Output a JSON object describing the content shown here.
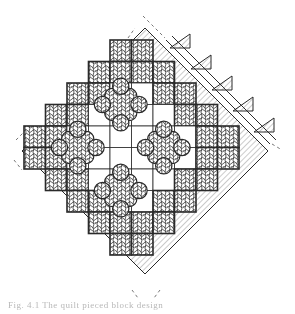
{
  "figure": {
    "type": "quilt-pattern-drawing",
    "grid": {
      "cell_size": 21.5,
      "origin_x": 24,
      "origin_y": 40,
      "rows": [
        {
          "start": 4,
          "cells": [
            "d",
            "d"
          ]
        },
        {
          "start": 3,
          "cells": [
            "d",
            "d",
            "d",
            "d"
          ]
        },
        {
          "start": 2,
          "cells": [
            "d",
            "d",
            "w",
            "w",
            "d",
            "d"
          ]
        },
        {
          "start": 1,
          "cells": [
            "d",
            "d",
            "w",
            "w",
            "w",
            "w",
            "d",
            "d"
          ]
        },
        {
          "start": 0,
          "cells": [
            "d",
            "d",
            "w",
            "w",
            "w",
            "w",
            "w",
            "w",
            "d",
            "d"
          ]
        },
        {
          "start": 0,
          "cells": [
            "d",
            "d",
            "w",
            "w",
            "w",
            "w",
            "w",
            "w",
            "d",
            "d"
          ]
        },
        {
          "start": 1,
          "cells": [
            "d",
            "d",
            "w",
            "w",
            "w",
            "w",
            "d",
            "d"
          ]
        },
        {
          "start": 2,
          "cells": [
            "d",
            "d",
            "w",
            "w",
            "d",
            "d"
          ]
        },
        {
          "start": 3,
          "cells": [
            "d",
            "d",
            "d",
            "d"
          ]
        },
        {
          "start": 4,
          "cells": [
            "d",
            "d"
          ]
        }
      ],
      "blob_centers": [
        [
          4.5,
          3.0
        ],
        [
          2.5,
          5.0
        ],
        [
          6.5,
          5.0
        ],
        [
          4.5,
          7.0
        ]
      ]
    },
    "colors": {
      "ink": "#2a2a2a",
      "dark_fill": "#5a5a5a",
      "hatch": "#6a6a6a",
      "paper": "#ffffff"
    },
    "sawtooth_count": 5
  },
  "caption": {
    "text": "Fig. 4.1 The quilt pieced block design"
  }
}
